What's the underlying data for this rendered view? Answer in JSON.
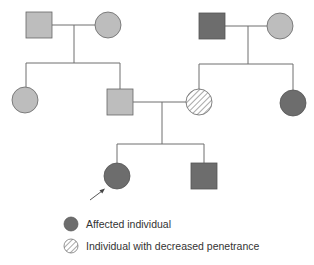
{
  "diagram": {
    "type": "pedigree",
    "colors": {
      "line": "#6e6e6e",
      "unaffected_fill": "#bdbdbd",
      "affected_fill": "#6d6d6d",
      "hatch_stroke": "#7a7a7a",
      "outline": "#555555"
    },
    "generations": [
      {
        "id": "I",
        "individuals": [
          {
            "id": "I-1",
            "sex": "male",
            "status": "unaffected"
          },
          {
            "id": "I-2",
            "sex": "female",
            "status": "unaffected"
          },
          {
            "id": "I-3",
            "sex": "male",
            "status": "affected"
          },
          {
            "id": "I-4",
            "sex": "female",
            "status": "unaffected"
          }
        ]
      },
      {
        "id": "II",
        "individuals": [
          {
            "id": "II-1",
            "sex": "female",
            "status": "unaffected"
          },
          {
            "id": "II-2",
            "sex": "male",
            "status": "unaffected"
          },
          {
            "id": "II-3",
            "sex": "female",
            "status": "decreased_penetrance"
          },
          {
            "id": "II-4",
            "sex": "female",
            "status": "affected"
          }
        ]
      },
      {
        "id": "III",
        "individuals": [
          {
            "id": "III-1",
            "sex": "female",
            "status": "affected",
            "proband": true
          },
          {
            "id": "III-2",
            "sex": "male",
            "status": "affected"
          }
        ]
      }
    ]
  },
  "legend": {
    "items": [
      {
        "label": "Affected individual",
        "symbol": "affected"
      },
      {
        "label": "Individual with decreased penetrance",
        "symbol": "hatched"
      }
    ]
  }
}
